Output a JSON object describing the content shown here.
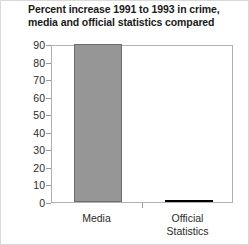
{
  "chart_data": {
    "type": "bar",
    "title": "Percent increase 1991 to 1993 in crime, media and official statistics compared",
    "title_lines": [
      "Percent increase 1991 to 1993 in crime,",
      "media and official statistics compared"
    ],
    "xlabel": "",
    "ylabel": "",
    "categories": [
      "Media",
      "Official Statistics"
    ],
    "category_label_lines": [
      [
        "Media"
      ],
      [
        "Official",
        "Statistics"
      ]
    ],
    "values": [
      90,
      1
    ],
    "ylim": [
      0,
      90
    ],
    "yticks": [
      0,
      10,
      20,
      30,
      40,
      50,
      60,
      70,
      80,
      90
    ],
    "ytick_labels": [
      "0",
      "10",
      "20",
      "30",
      "40",
      "50",
      "60",
      "70",
      "80",
      "90"
    ],
    "grid": false,
    "legend": false,
    "legend_position": "none",
    "bar_colors": [
      "#969696",
      "#121212"
    ],
    "bar_edge_colors": [
      "#6e6e6e",
      "#000000"
    ],
    "plot_background": "#ffffff",
    "axis_color": "#b0b0b0",
    "text_color": "#2b2b2b",
    "annotations": []
  }
}
